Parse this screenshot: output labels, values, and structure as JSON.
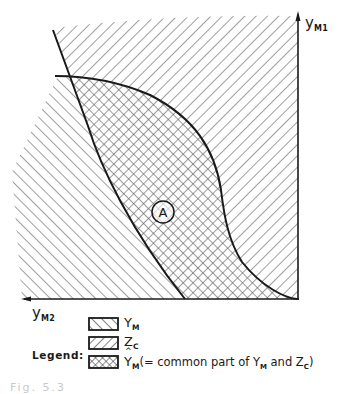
{
  "figure": {
    "axes": {
      "vertical": {
        "label": "y",
        "subscript": "M1"
      },
      "horizontal": {
        "label": "y",
        "subscript": "M2"
      }
    },
    "region_marker": {
      "label": "A"
    },
    "colors": {
      "ink": "#1a1a1a",
      "hatch": "#555555",
      "background": "#ffffff"
    }
  },
  "legend": {
    "title": "Legend:",
    "items": [
      {
        "pattern": "forward-hatch",
        "symbol": "Y",
        "subscript": "M",
        "description": ""
      },
      {
        "pattern": "back-hatch",
        "symbol": "Z",
        "subscript": "C",
        "description": ""
      },
      {
        "pattern": "cross-hatch",
        "symbol": "Y",
        "subscript": "M",
        "hat": true,
        "description_prefix": "(= common part of Y",
        "description_sub1": "M",
        "description_mid": " and Z",
        "description_sub2": "C",
        "description_suffix": ")"
      }
    ]
  },
  "caption": "Fig. 5.3"
}
